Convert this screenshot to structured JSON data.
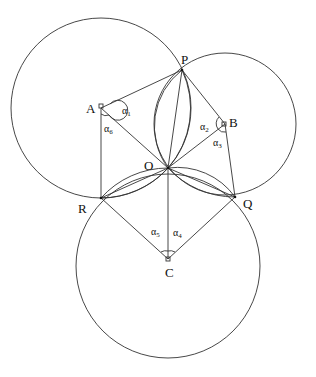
{
  "diagram": {
    "points": {
      "P": {
        "label": "P",
        "x": 182,
        "y": 70
      },
      "A": {
        "label": "A",
        "x": 101,
        "y": 108
      },
      "B": {
        "label": "B",
        "x": 225,
        "y": 124
      },
      "O": {
        "label": "O",
        "x": 168,
        "y": 168
      },
      "R": {
        "label": "R",
        "x": 101,
        "y": 198
      },
      "Q": {
        "label": "Q",
        "x": 235,
        "y": 197
      },
      "C": {
        "label": "C",
        "x": 168,
        "y": 259
      }
    },
    "circles": [
      {
        "center": "A",
        "r": 90
      },
      {
        "center": "B",
        "r": 71
      },
      {
        "center": "C",
        "r": 92
      }
    ],
    "angles": [
      {
        "label": "α",
        "sub": "1"
      },
      {
        "label": "α",
        "sub": "2"
      },
      {
        "label": "α",
        "sub": "3"
      },
      {
        "label": "α",
        "sub": "4"
      },
      {
        "label": "α",
        "sub": "5"
      },
      {
        "label": "α",
        "sub": "6"
      }
    ]
  }
}
